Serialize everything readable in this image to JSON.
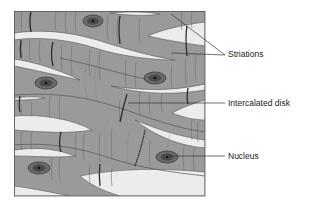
{
  "diagram": {
    "colors": {
      "cell": "#9a9a9a",
      "cell_dark": "#8a8a8a",
      "gap": "#ececec",
      "striation": "#6e6e6e",
      "disk": "#2e2e2e",
      "nucleus_outer": "#6a6a6a",
      "nucleus_inner": "#4a4a4a",
      "nucleolus": "#111111",
      "frame": "#555555",
      "leader": "#333333"
    },
    "labels": [
      {
        "id": "striations",
        "text": "Striations",
        "x": 228,
        "y": 50
      },
      {
        "id": "intercalated-disk",
        "text": "Intercalated disk",
        "x": 228,
        "y": 99
      },
      {
        "id": "nucleus",
        "text": "Nucleus",
        "x": 228,
        "y": 152
      }
    ],
    "nuclei": [
      {
        "cx": 93,
        "cy": 21
      },
      {
        "cx": 46,
        "cy": 83
      },
      {
        "cx": 155,
        "cy": 78
      },
      {
        "cx": 167,
        "cy": 157
      },
      {
        "cx": 39,
        "cy": 168
      }
    ]
  }
}
